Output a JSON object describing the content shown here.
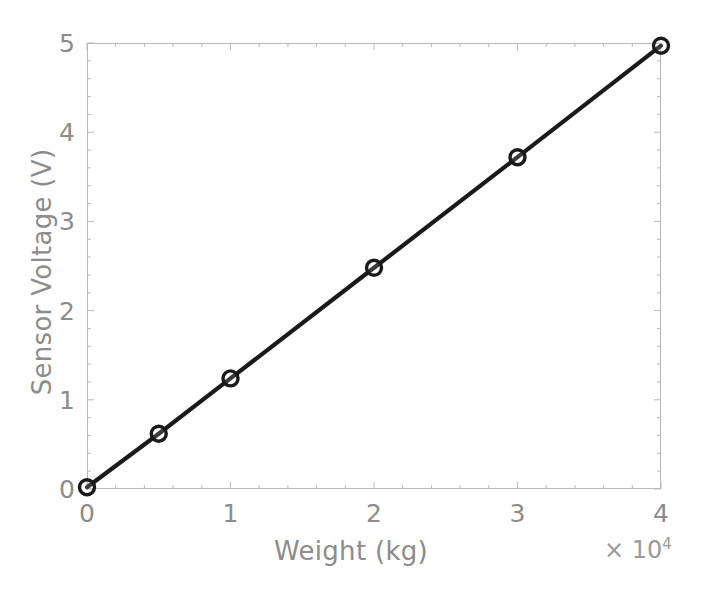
{
  "chart_data": {
    "type": "line",
    "title": "",
    "xlabel": "Weight (kg)",
    "ylabel": "Sensor Voltage (V)",
    "x_exponent_label": "× 10",
    "x_exponent_power": "4",
    "x_scale_multiplier": 10000,
    "xlim": [
      0,
      40000
    ],
    "ylim": [
      0,
      5
    ],
    "xticks": [
      0,
      10000,
      20000,
      30000,
      40000
    ],
    "xtick_labels": [
      "0",
      "1",
      "2",
      "3",
      "4"
    ],
    "yticks": [
      0,
      1,
      2,
      3,
      4,
      5
    ],
    "ytick_labels": [
      "0",
      "1",
      "2",
      "3",
      "4",
      "5"
    ],
    "grid": false,
    "legend": null,
    "marker": "circle-open",
    "line_color": "#1a1a1a",
    "marker_edge_color": "#1a1a1a",
    "marker_face_color": "#ffffff",
    "axis_color": "#b9b9b9",
    "text_color": "#8c8c8c",
    "background_color": "#ffffff",
    "series": [
      {
        "name": "Sensor calibration",
        "x": [
          0,
          5000,
          10000,
          20000,
          30000,
          40000
        ],
        "y": [
          0.02,
          0.62,
          1.24,
          2.48,
          3.72,
          4.97
        ]
      }
    ]
  }
}
